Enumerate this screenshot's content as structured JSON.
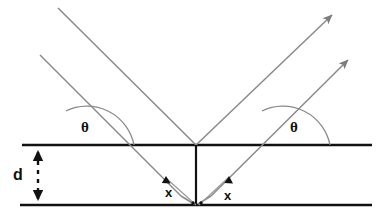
{
  "figure": {
    "kind": "physics-ray-diagram",
    "background_color": "#ffffff",
    "plane_color": "#111111",
    "ray_color": "#8a8a8a",
    "arc_color": "#8a8a8a",
    "label_color": "#111111"
  },
  "labels": {
    "theta_left": "θ",
    "theta_right": "θ",
    "spacing_d": "d",
    "path_x_left": "x",
    "path_x_right": "x"
  },
  "geometry": {
    "top_plane": {
      "x1": 22,
      "y1": 145,
      "x2": 372,
      "y2": 145
    },
    "bottom_plane": {
      "x1": 20,
      "y1": 205,
      "x2": 372,
      "y2": 205
    },
    "scatter_point_top": {
      "x": 196,
      "y": 145
    },
    "scatter_point_bottom": {
      "x": 196,
      "y": 205
    },
    "incident_angle_deg": 45,
    "reflected_angle_deg": 45,
    "interplanar_spacing_px": 60
  },
  "rays": {
    "incoming": [
      {
        "name": "incoming-ray-upper",
        "x1": 58,
        "y1": 8,
        "x2": 196,
        "y2": 145,
        "arrowhead": false
      },
      {
        "name": "incoming-ray-lower",
        "x1": 40,
        "y1": 55,
        "x2": 181,
        "y2": 196,
        "arrowhead": false
      }
    ],
    "outgoing": [
      {
        "name": "outgoing-ray-upper",
        "x1": 196,
        "y1": 145,
        "x2": 334,
        "y2": 13,
        "arrowhead": true
      },
      {
        "name": "outgoing-ray-lower",
        "x1": 211,
        "y1": 196,
        "x2": 350,
        "y2": 58,
        "arrowhead": true
      }
    ]
  },
  "annotations": {
    "d_arrow": {
      "x": 38,
      "y_top": 151,
      "y_bottom": 200,
      "style": "double-headed-dashed"
    },
    "x_marker_left": {
      "x": 170,
      "y": 192
    },
    "x_marker_right": {
      "x": 228,
      "y": 196
    }
  }
}
